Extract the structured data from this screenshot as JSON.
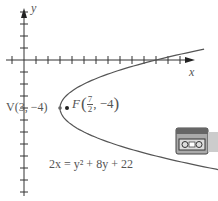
{
  "axes": {
    "x_label": "x",
    "y_label": "y",
    "origin_px": [
      24,
      60
    ],
    "tick_spacing_px": 12,
    "x_ticks": 13,
    "y_ticks_up": 4,
    "y_ticks_down": 12
  },
  "vertex": {
    "label": "V(3, −4)",
    "x": 3,
    "y": -4
  },
  "focus": {
    "label_prefix": "F",
    "x_num": "7",
    "x_den": "2",
    "y_text": "−4",
    "x": 3.5,
    "y": -4
  },
  "equation": "2x = y² + 8y + 22",
  "colors": {
    "axis": "#333333",
    "curve": "#555555",
    "text": "#555555",
    "point": "#222222"
  },
  "icon": "video-camera-icon"
}
